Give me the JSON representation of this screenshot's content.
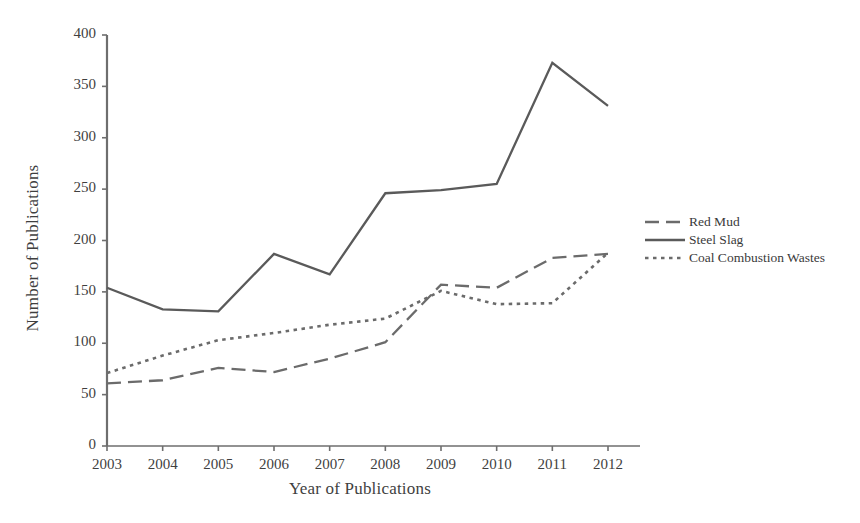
{
  "chart_data": {
    "type": "line",
    "title": "",
    "xlabel": "Year of Publications",
    "ylabel": "Number of Publications",
    "categories": [
      "2003",
      "2004",
      "2005",
      "2006",
      "2007",
      "2008",
      "2009",
      "2010",
      "2011",
      "2012"
    ],
    "x": [
      2003,
      2004,
      2005,
      2006,
      2007,
      2008,
      2009,
      2010,
      2011,
      2012
    ],
    "xlim": [
      2003,
      2012
    ],
    "ylim": [
      0,
      400
    ],
    "yticks": [
      0,
      50,
      100,
      150,
      200,
      250,
      300,
      350,
      400
    ],
    "ytick_labels": [
      "0",
      "50",
      "100",
      "150",
      "200",
      "250",
      "300",
      "350",
      "400"
    ],
    "grid": false,
    "legend_position": "right",
    "series": [
      {
        "name": "Red Mud",
        "style": "dashed",
        "color": "#6b6b6b",
        "values": [
          61,
          64,
          76,
          72,
          85,
          101,
          157,
          154,
          183,
          187
        ]
      },
      {
        "name": "Steel Slag",
        "style": "solid",
        "color": "#5a5a5a",
        "values": [
          154,
          133,
          131,
          187,
          167,
          246,
          249,
          255,
          373,
          331
        ]
      },
      {
        "name": "Coal Combustion Wastes",
        "style": "dotted",
        "color": "#6b6b6b",
        "values": [
          71,
          88,
          103,
          110,
          118,
          124,
          151,
          138,
          139,
          188
        ]
      }
    ]
  },
  "axes": {
    "y_title": "Number of Publications",
    "x_title": "Year of Publications"
  },
  "legend": {
    "items": [
      {
        "label": "Red Mud",
        "swatch": "dashed-line-icon"
      },
      {
        "label": "Steel Slag",
        "swatch": "solid-line-icon"
      },
      {
        "label": "Coal Combustion Wastes",
        "swatch": "dotted-line-icon"
      }
    ]
  },
  "colors": {
    "axis": "#6e6e6e",
    "text": "#3f3f3f",
    "red_mud": "#6b6b6b",
    "steel_slag": "#5a5a5a",
    "coal_combustion": "#6b6b6b"
  }
}
